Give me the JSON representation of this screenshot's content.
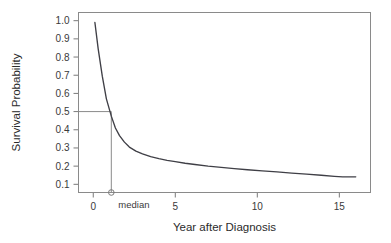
{
  "chart_data": {
    "type": "line",
    "title": "",
    "xlabel": "Year after Diagnosis",
    "ylabel": "Survival Probability",
    "xlim": [
      -0.9,
      16.9
    ],
    "ylim": [
      0.055,
      1.045
    ],
    "grid": false,
    "legend": null,
    "xticks": [
      0,
      5,
      10,
      15
    ],
    "xtick_labels": [
      "0",
      "5",
      "10",
      "15"
    ],
    "yticks": [
      0.1,
      0.2,
      0.3,
      0.4,
      0.5,
      0.6,
      0.7,
      0.8,
      0.9,
      1.0
    ],
    "ytick_labels": [
      "0.1",
      "0.2",
      "0.3",
      "0.4",
      "0.5",
      "0.6",
      "0.7",
      "0.8",
      "0.9",
      "1.0"
    ],
    "series": [
      {
        "name": "survival curve",
        "x": [
          0.1,
          0.3,
          0.55,
          0.8,
          1.1,
          1.35,
          1.6,
          1.9,
          2.2,
          2.6,
          3.0,
          3.5,
          4.0,
          4.5,
          5.0,
          5.6,
          6.2,
          7.0,
          7.8,
          8.6,
          9.4,
          10.3,
          11.2,
          12.1,
          13.0,
          13.9,
          14.7,
          15.2,
          16.0
        ],
        "y": [
          0.99,
          0.845,
          0.695,
          0.57,
          0.475,
          0.41,
          0.368,
          0.332,
          0.305,
          0.283,
          0.268,
          0.252,
          0.241,
          0.232,
          0.225,
          0.216,
          0.209,
          0.2,
          0.193,
          0.186,
          0.18,
          0.174,
          0.168,
          0.162,
          0.156,
          0.15,
          0.144,
          0.141,
          0.141
        ]
      }
    ],
    "annotations": [
      {
        "name": "median",
        "label": "median",
        "x": 1.1,
        "y": 0.5,
        "marker": "open-circle",
        "guide_horizontal_from_x": -0.9,
        "guide_vertical_to_y": 0.055
      }
    ],
    "colors": {
      "curve": "#3f3f46",
      "frame": "#8a8a8a",
      "guide": "#8a8a8a",
      "tick": "#7a7a7a",
      "text": "#2b2b2b",
      "background": "#ffffff"
    }
  }
}
